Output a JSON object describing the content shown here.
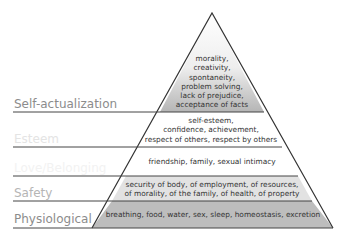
{
  "levels": [
    {
      "label": "Self-actualization",
      "lines": [
        "morality,",
        "creativity,",
        "spontaneity,",
        "problem solving,",
        "lack of prejudice,",
        "acceptance of facts"
      ]
    },
    {
      "label": "Esteem",
      "lines": [
        "self-esteem,",
        "confidence, achievement,",
        "respect of others, respect by others"
      ]
    },
    {
      "label": "Love/Belonging",
      "lines": [
        "friendship, family, sexual intimacy"
      ]
    },
    {
      "label": "Safety",
      "lines": [
        "security of body, of employment, of resources,",
        "of morality, of the family, of health, of property"
      ]
    },
    {
      "label": "Physiological",
      "lines": [
        "breathing, food, water, sex, sleep, homeostasis, excretion"
      ]
    }
  ],
  "colors": {
    "self_actualization_top": "#ffffff",
    "self_actualization_bottom": "#b8b8b8",
    "esteem": "#ffffff",
    "love": "#ffffff",
    "safety": "#e2e2e2",
    "physiological": "#bdbdbd",
    "line": "#333333"
  }
}
